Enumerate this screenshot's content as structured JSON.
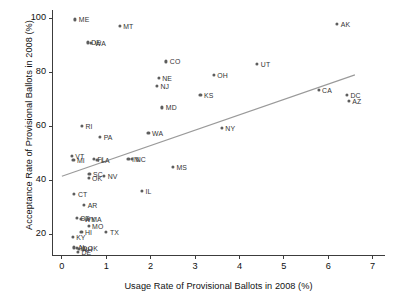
{
  "chart_data": {
    "type": "scatter",
    "title": "",
    "xlabel": "Usage Rate of Provisional Ballots in 2008 (%)",
    "ylabel": "Acceptance Rate of Provisional Ballots in 2008 (%)",
    "xlim": [
      -0.2,
      7.3
    ],
    "ylim": [
      12,
      103
    ],
    "xticks": [
      0,
      1,
      2,
      3,
      4,
      5,
      6,
      7
    ],
    "yticks": [
      20,
      40,
      60,
      80,
      100
    ],
    "grid": false,
    "legend": null,
    "point_color": "#5d5d5d",
    "line_color": "#9a9a9a",
    "axis_color": "#3c3c3c",
    "fit_line": {
      "type": "linear-fit",
      "x_start": 0.0,
      "y_start": 41.5,
      "x_end": 6.6,
      "y_end": 79.0
    },
    "points": [
      {
        "label": "ME",
        "x": 0.3,
        "y": 99.5,
        "side": "right"
      },
      {
        "label": "MT",
        "x": 1.3,
        "y": 97.0,
        "side": "right"
      },
      {
        "label": "DE",
        "x": 0.58,
        "y": 91.0,
        "side": "right"
      },
      {
        "label": "WA",
        "x": 0.66,
        "y": 90.8,
        "side": "right"
      },
      {
        "label": "AK",
        "x": 6.2,
        "y": 98.0,
        "side": "right"
      },
      {
        "label": "CO",
        "x": 2.35,
        "y": 84.0,
        "side": "right"
      },
      {
        "label": "UT",
        "x": 4.4,
        "y": 83.0,
        "side": "right"
      },
      {
        "label": "OH",
        "x": 3.42,
        "y": 79.0,
        "side": "right"
      },
      {
        "label": "NE",
        "x": 2.18,
        "y": 78.0,
        "side": "right"
      },
      {
        "label": "NJ",
        "x": 2.14,
        "y": 75.0,
        "side": "right"
      },
      {
        "label": "CA",
        "x": 5.78,
        "y": 73.5,
        "side": "right"
      },
      {
        "label": "KS",
        "x": 3.12,
        "y": 71.5,
        "side": "right"
      },
      {
        "label": "DC",
        "x": 6.42,
        "y": 71.5,
        "side": "right"
      },
      {
        "label": "AZ",
        "x": 6.46,
        "y": 69.5,
        "side": "right"
      },
      {
        "label": "MD",
        "x": 2.26,
        "y": 67.0,
        "side": "right"
      },
      {
        "label": "RI",
        "x": 0.45,
        "y": 60.0,
        "side": "right"
      },
      {
        "label": "NY",
        "x": 3.6,
        "y": 59.5,
        "side": "right"
      },
      {
        "label": "WA2",
        "x": 1.95,
        "y": 57.5,
        "side": "right"
      },
      {
        "label": "PA",
        "x": 0.86,
        "y": 56.0,
        "side": "right"
      },
      {
        "label": "VT",
        "x": 0.22,
        "y": 49.0,
        "side": "right"
      },
      {
        "label": "MI",
        "x": 0.26,
        "y": 47.5,
        "side": "right"
      },
      {
        "label": "FL",
        "x": 0.72,
        "y": 48.0,
        "side": "right"
      },
      {
        "label": "LA",
        "x": 0.8,
        "y": 47.6,
        "side": "right"
      },
      {
        "label": "IN",
        "x": 1.5,
        "y": 48.0,
        "side": "right"
      },
      {
        "label": "NC",
        "x": 1.58,
        "y": 47.8,
        "side": "right"
      },
      {
        "label": "MS",
        "x": 2.5,
        "y": 45.0,
        "side": "right"
      },
      {
        "label": "SC",
        "x": 0.62,
        "y": 42.5,
        "side": "right"
      },
      {
        "label": "OK",
        "x": 0.6,
        "y": 41.0,
        "side": "right"
      },
      {
        "label": "NV",
        "x": 0.95,
        "y": 41.5,
        "side": "right"
      },
      {
        "label": "IL",
        "x": 1.8,
        "y": 36.0,
        "side": "right"
      },
      {
        "label": "CT",
        "x": 0.28,
        "y": 35.0,
        "side": "right"
      },
      {
        "label": "AR",
        "x": 0.5,
        "y": 31.0,
        "side": "right"
      },
      {
        "label": "SD",
        "x": 0.34,
        "y": 26.0,
        "side": "right"
      },
      {
        "label": "WY",
        "x": 0.42,
        "y": 25.8,
        "side": "right"
      },
      {
        "label": "MA",
        "x": 0.58,
        "y": 25.6,
        "side": "right"
      },
      {
        "label": "MO",
        "x": 0.6,
        "y": 23.0,
        "side": "right"
      },
      {
        "label": "HI",
        "x": 0.44,
        "y": 21.0,
        "side": "right"
      },
      {
        "label": "TX",
        "x": 1.0,
        "y": 21.0,
        "side": "right"
      },
      {
        "label": "KY",
        "x": 0.24,
        "y": 19.0,
        "side": "right"
      },
      {
        "label": "AL",
        "x": 0.28,
        "y": 15.2,
        "side": "right"
      },
      {
        "label": "ID",
        "x": 0.33,
        "y": 15.0,
        "side": "right"
      },
      {
        "label": "NH",
        "x": 0.38,
        "y": 14.6,
        "side": "right"
      },
      {
        "label": "DE2",
        "x": 0.36,
        "y": 13.6,
        "side": "right"
      },
      {
        "label": "OK2",
        "x": 0.5,
        "y": 15.0,
        "side": "right"
      }
    ]
  }
}
